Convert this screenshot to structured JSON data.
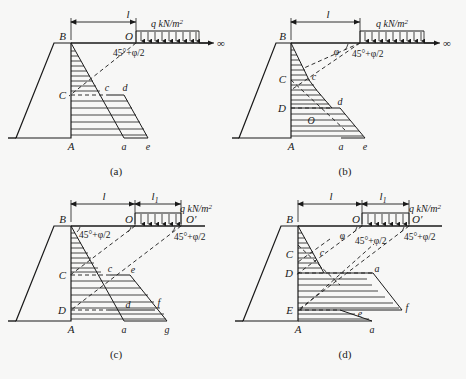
{
  "figure": {
    "kind": "engineering-diagram",
    "background_color": "#f7f7f6",
    "line_color": "#1a1a1a",
    "panels": [
      {
        "id": "a",
        "caption": "(a)",
        "dimension_labels": [
          "l"
        ],
        "load_label": "q  kN/m",
        "load_exponent": "2",
        "infinity_symbol": "∞",
        "angle_labels": [
          "45°+φ/2"
        ],
        "upper_case_points": [
          "B",
          "C",
          "A"
        ],
        "lower_case_points": [
          "c",
          "d",
          "a",
          "e"
        ],
        "has_phi_angle": false,
        "has_second_dimension": false
      },
      {
        "id": "b",
        "caption": "(b)",
        "dimension_labels": [
          "l"
        ],
        "load_label": "q  kN/m",
        "load_exponent": "2",
        "infinity_symbol": "∞",
        "angle_labels": [
          "45°+φ/2",
          "φ"
        ],
        "upper_case_points": [
          "B",
          "C",
          "D",
          "A",
          "O"
        ],
        "lower_case_points": [
          "c",
          "d",
          "a",
          "e"
        ],
        "has_phi_angle": true,
        "has_second_dimension": false
      },
      {
        "id": "c",
        "caption": "(c)",
        "dimension_labels": [
          "l",
          "l"
        ],
        "dimension_subscripts": [
          "",
          "1"
        ],
        "load_label": "q  kN/m",
        "load_exponent": "2",
        "angle_labels": [
          "45°+φ/2",
          "45°+φ/2"
        ],
        "upper_case_points": [
          "B",
          "C",
          "D",
          "A",
          "O",
          "O′"
        ],
        "lower_case_points": [
          "c",
          "e",
          "d",
          "f",
          "a",
          "g"
        ],
        "has_phi_angle": false,
        "has_second_dimension": true
      },
      {
        "id": "d",
        "caption": "(d)",
        "dimension_labels": [
          "l",
          "l"
        ],
        "dimension_subscripts": [
          "",
          "1"
        ],
        "load_label": "q  kN/m",
        "load_exponent": "2",
        "angle_labels": [
          "φ",
          "45°+φ/2",
          "45°+φ/2"
        ],
        "upper_case_points": [
          "B",
          "C",
          "D",
          "E",
          "A",
          "O",
          "O′"
        ],
        "lower_case_points": [
          "c",
          "a",
          "e",
          "f",
          "a"
        ],
        "has_phi_angle": true,
        "has_second_dimension": true
      }
    ]
  }
}
